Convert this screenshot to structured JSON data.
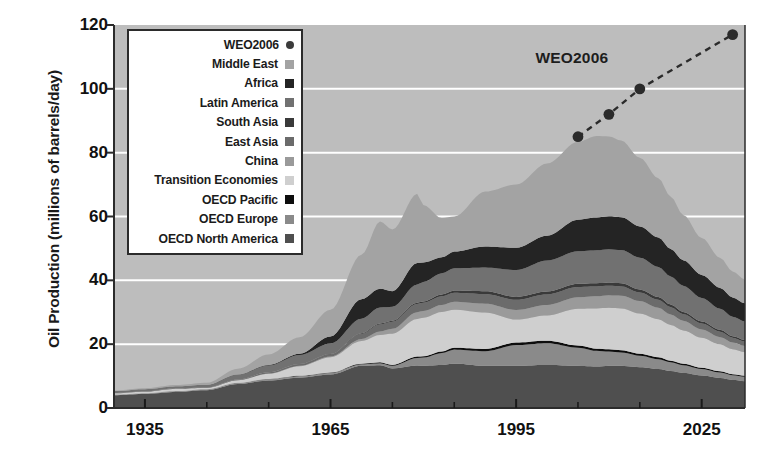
{
  "chart_data": {
    "type": "area",
    "title": "",
    "subtitle": "",
    "xlabel": "",
    "ylabel": "Oil Production (millions of barrels/day)",
    "xlim": [
      1930,
      2032
    ],
    "ylim": [
      0,
      120
    ],
    "xticks": [
      "1935",
      "1965",
      "1995",
      "2025"
    ],
    "xtick_values": [
      1935,
      1965,
      1995,
      2025
    ],
    "xminor_step": 10,
    "yticks": [
      "0",
      "20",
      "40",
      "60",
      "80",
      "100",
      "120"
    ],
    "ytick_values": [
      0,
      20,
      40,
      60,
      80,
      100,
      120
    ],
    "grid": "horizontal-white",
    "legend_position": "upper-left-inside",
    "plot_background": "#bdbdbd",
    "stacked": true,
    "x": [
      1930,
      1935,
      1940,
      1945,
      1950,
      1955,
      1960,
      1965,
      1970,
      1973,
      1975,
      1979,
      1980,
      1983,
      1985,
      1990,
      1995,
      2000,
      2005,
      2008,
      2010,
      2012,
      2015,
      2018,
      2020,
      2022,
      2025,
      2028,
      2030,
      2032
    ],
    "series": [
      {
        "name": "OECD North America",
        "color": "#4f4f4f",
        "values": [
          4.0,
          4.4,
          5.0,
          5.6,
          7.5,
          8.6,
          9.5,
          10.5,
          13.2,
          13.4,
          12.4,
          13.3,
          13.2,
          13.5,
          13.9,
          13.2,
          13.2,
          13.5,
          13.2,
          13.0,
          13.2,
          13.2,
          12.8,
          12.2,
          11.6,
          11.0,
          10.2,
          9.4,
          8.8,
          8.4
        ]
      },
      {
        "name": "OECD Europe",
        "color": "#8a8a8a",
        "values": [
          0.2,
          0.2,
          0.3,
          0.3,
          0.4,
          0.5,
          0.5,
          0.5,
          0.5,
          0.6,
          0.8,
          2.4,
          2.6,
          3.7,
          4.4,
          4.6,
          6.5,
          6.8,
          5.7,
          4.9,
          4.5,
          4.2,
          3.6,
          3.1,
          2.7,
          2.4,
          2.0,
          1.7,
          1.5,
          1.4
        ]
      },
      {
        "name": "OECD Pacific",
        "color": "#0d0d0d",
        "values": [
          0.0,
          0.0,
          0.0,
          0.0,
          0.0,
          0.0,
          0.1,
          0.1,
          0.2,
          0.3,
          0.3,
          0.4,
          0.4,
          0.5,
          0.6,
          0.7,
          0.8,
          0.8,
          0.7,
          0.7,
          0.7,
          0.7,
          0.6,
          0.6,
          0.5,
          0.5,
          0.4,
          0.4,
          0.3,
          0.3
        ]
      },
      {
        "name": "Transition Economies",
        "color": "#cfcfcf",
        "values": [
          0.4,
          0.5,
          0.7,
          0.4,
          0.8,
          1.6,
          3.0,
          4.8,
          7.1,
          8.6,
          9.8,
          11.8,
          12.1,
          12.4,
          11.9,
          11.4,
          7.2,
          7.9,
          11.5,
          12.6,
          13.0,
          13.1,
          12.6,
          11.9,
          11.2,
          10.4,
          9.4,
          8.4,
          7.8,
          7.4
        ]
      },
      {
        "name": "China",
        "color": "#9a9a9a",
        "values": [
          0.0,
          0.0,
          0.0,
          0.0,
          0.0,
          0.1,
          0.1,
          0.2,
          0.6,
          1.1,
          1.5,
          2.1,
          2.1,
          2.2,
          2.5,
          2.8,
          3.0,
          3.3,
          3.6,
          3.8,
          3.9,
          4.0,
          3.9,
          3.6,
          3.3,
          3.0,
          2.6,
          2.3,
          2.1,
          1.9
        ]
      },
      {
        "name": "East Asia",
        "color": "#6b6b6b",
        "values": [
          0.1,
          0.1,
          0.2,
          0.1,
          0.2,
          0.4,
          0.5,
          0.7,
          1.6,
          2.2,
          2.2,
          2.6,
          2.6,
          2.7,
          2.8,
          3.0,
          3.2,
          3.3,
          3.2,
          3.1,
          3.0,
          2.9,
          2.7,
          2.5,
          2.3,
          2.1,
          1.9,
          1.7,
          1.5,
          1.4
        ]
      },
      {
        "name": "South Asia",
        "color": "#3a3a3a",
        "values": [
          0.0,
          0.0,
          0.0,
          0.0,
          0.0,
          0.0,
          0.1,
          0.1,
          0.2,
          0.3,
          0.3,
          0.4,
          0.4,
          0.6,
          0.7,
          0.9,
          0.9,
          0.9,
          1.0,
          1.0,
          1.0,
          1.0,
          0.9,
          0.9,
          0.8,
          0.7,
          0.6,
          0.6,
          0.5,
          0.5
        ]
      },
      {
        "name": "Latin America",
        "color": "#717171",
        "values": [
          0.6,
          0.7,
          0.6,
          0.9,
          1.5,
          2.1,
          2.8,
          3.3,
          4.6,
          5.0,
          4.4,
          5.7,
          6.1,
          6.6,
          7.0,
          7.4,
          8.4,
          9.7,
          10.2,
          10.3,
          10.4,
          10.4,
          10.0,
          9.4,
          8.8,
          8.2,
          7.4,
          6.6,
          6.1,
          5.8
        ]
      },
      {
        "name": "Africa",
        "color": "#242424",
        "values": [
          0.0,
          0.0,
          0.0,
          0.0,
          0.1,
          0.2,
          0.4,
          2.2,
          6.1,
          5.9,
          4.9,
          6.7,
          6.1,
          5.0,
          5.2,
          6.6,
          7.0,
          7.8,
          9.9,
          10.3,
          10.4,
          10.3,
          9.8,
          9.2,
          8.6,
          8.0,
          7.2,
          6.5,
          6.0,
          5.7
        ]
      },
      {
        "name": "Middle East",
        "color": "#a3a3a3",
        "values": [
          0.2,
          0.3,
          0.4,
          0.6,
          1.8,
          3.3,
          5.2,
          8.4,
          13.9,
          21.0,
          19.3,
          21.7,
          18.0,
          12.3,
          11.0,
          17.2,
          19.8,
          22.6,
          24.4,
          25.5,
          25.0,
          24.0,
          21.5,
          18.6,
          16.4,
          14.2,
          11.6,
          9.4,
          8.2,
          7.5
        ]
      }
    ],
    "projection": {
      "name": "WEO2006",
      "color": "#2b2b2b",
      "style": "dashed-with-markers",
      "annotation": "WEO2006",
      "points": [
        {
          "x": 2005,
          "y": 85
        },
        {
          "x": 2010,
          "y": 92
        },
        {
          "x": 2015,
          "y": 100
        },
        {
          "x": 2030,
          "y": 117
        }
      ]
    }
  },
  "legend": {
    "items": [
      {
        "label": "WEO2006",
        "color": "#3b3b3b",
        "marker": "dot"
      },
      {
        "label": "Middle East",
        "color": "#a3a3a3",
        "marker": "square"
      },
      {
        "label": "Africa",
        "color": "#242424",
        "marker": "square"
      },
      {
        "label": "Latin America",
        "color": "#717171",
        "marker": "square"
      },
      {
        "label": "South Asia",
        "color": "#3a3a3a",
        "marker": "square"
      },
      {
        "label": "East Asia",
        "color": "#6b6b6b",
        "marker": "square"
      },
      {
        "label": "China",
        "color": "#9a9a9a",
        "marker": "square"
      },
      {
        "label": "Transition Economies",
        "color": "#cfcfcf",
        "marker": "square"
      },
      {
        "label": "OECD Pacific",
        "color": "#0d0d0d",
        "marker": "square"
      },
      {
        "label": "OECD Europe",
        "color": "#8a8a8a",
        "marker": "square"
      },
      {
        "label": "OECD North America",
        "color": "#4f4f4f",
        "marker": "square"
      }
    ]
  },
  "annotations": {
    "weo_label": "WEO2006"
  }
}
